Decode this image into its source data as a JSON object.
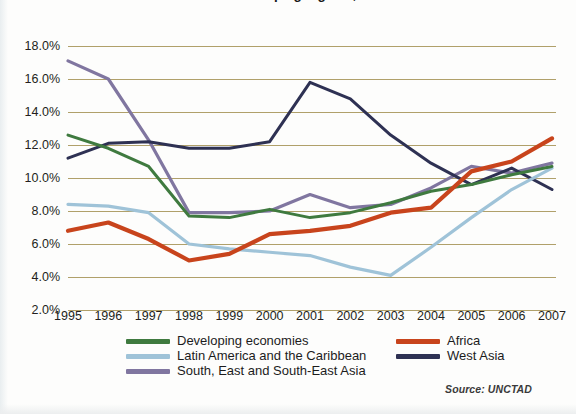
{
  "title": "Rates of Return on Inward FDI in developing regions, 1995-2007",
  "source_note": "Source: UNCTAD",
  "legend": {
    "left_column": [
      {
        "label": "Developing economies",
        "color": "#3f7a3f"
      },
      {
        "label": "Latin America and the Caribbean",
        "color": "#9fc3d8"
      },
      {
        "label": "South, East and South-East Asia",
        "color": "#8076a0"
      }
    ],
    "right_column": [
      {
        "label": "Africa",
        "color": "#c8441c"
      },
      {
        "label": "West Asia",
        "color": "#2e3153"
      }
    ]
  },
  "chart_data": {
    "type": "line",
    "title": "Rates of Return on Inward FDI in developing regions, 1995-2007",
    "xlabel": "",
    "ylabel": "",
    "ylim": [
      2.0,
      18.0
    ],
    "ytick_values": [
      2.0,
      4.0,
      6.0,
      8.0,
      10.0,
      12.0,
      14.0,
      16.0,
      18.0
    ],
    "ytick_labels": [
      "2.0%",
      "4.0%",
      "6.0%",
      "8.0%",
      "10.0%",
      "12.0%",
      "14.0%",
      "16.0%",
      "18.0%"
    ],
    "grid": true,
    "grid_axis": "y",
    "legend_position": "bottom",
    "categories": [
      1995,
      1996,
      1997,
      1998,
      1999,
      2000,
      2001,
      2002,
      2003,
      2004,
      2005,
      2006,
      2007
    ],
    "x": [
      "1995",
      "1996",
      "1997",
      "1998",
      "1999",
      "2000",
      "2001",
      "2002",
      "2003",
      "2004",
      "2005",
      "2006",
      "2007"
    ],
    "series": [
      {
        "name": "Developing economies",
        "color": "#3f7a3f",
        "values": [
          12.6,
          11.8,
          10.7,
          7.7,
          7.6,
          8.1,
          7.6,
          7.9,
          8.5,
          9.2,
          9.6,
          10.2,
          10.7
        ]
      },
      {
        "name": "Africa",
        "color": "#c8441c",
        "values": [
          6.8,
          7.3,
          6.3,
          5.0,
          5.4,
          6.6,
          6.8,
          7.1,
          7.9,
          8.2,
          10.4,
          11.0,
          12.4
        ]
      },
      {
        "name": "Latin America and the Caribbean",
        "color": "#9fc3d8",
        "values": [
          8.4,
          8.3,
          7.9,
          6.0,
          5.7,
          5.5,
          5.3,
          4.6,
          4.1,
          5.8,
          7.6,
          9.3,
          10.6
        ]
      },
      {
        "name": "West Asia",
        "color": "#2e3153",
        "values": [
          11.2,
          12.1,
          12.2,
          11.8,
          11.8,
          12.2,
          15.8,
          14.8,
          12.6,
          10.9,
          9.6,
          10.6,
          9.3
        ]
      },
      {
        "name": "South, East and South-East Asia",
        "color": "#8076a0",
        "values": [
          17.1,
          16.0,
          12.3,
          7.9,
          7.9,
          8.0,
          9.0,
          8.2,
          8.4,
          9.4,
          10.7,
          10.3,
          10.9
        ]
      }
    ]
  }
}
